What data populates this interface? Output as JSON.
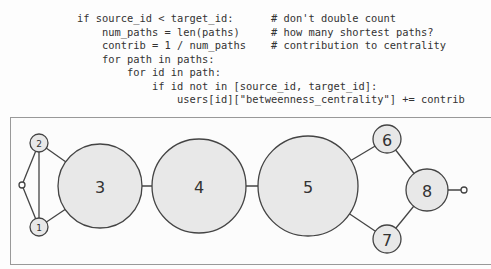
{
  "code": {
    "lines": [
      {
        "indent": 0,
        "code": "if source_id < target_id:",
        "comment": "# don't double count"
      },
      {
        "indent": 1,
        "code": "num_paths = len(paths)",
        "comment": "# how many shortest paths?"
      },
      {
        "indent": 1,
        "code": "contrib = 1 / num_paths",
        "comment": "# contribution to centrality"
      },
      {
        "indent": 1,
        "code": "for path in paths:",
        "comment": ""
      },
      {
        "indent": 2,
        "code": "for id in path:",
        "comment": ""
      },
      {
        "indent": 3,
        "code": "if id not in [source_id, target_id]:",
        "comment": ""
      },
      {
        "indent": 4,
        "code": "users[id][\"betweenness_centrality\"] += contrib",
        "comment": ""
      }
    ],
    "line0": "if source_id < target_id:      # don't double count",
    "line1": "    num_paths = len(paths)     # how many shortest paths?",
    "line2": "    contrib = 1 / num_paths    # contribution to centrality",
    "line3": "    for path in paths:",
    "line4": "        for id in path:",
    "line5": "            if id not in [source_id, target_id]:",
    "line6": "                users[id][\"betweenness_centrality\"] += contrib"
  },
  "graph": {
    "node_fill": "#e8e8e8",
    "stroke": "#444444",
    "nodes": [
      {
        "id": "0",
        "label": "",
        "x": 22,
        "y": 185,
        "r": 3
      },
      {
        "id": "1",
        "label": "1",
        "x": 39,
        "y": 227,
        "r": 9
      },
      {
        "id": "2",
        "label": "2",
        "x": 39,
        "y": 143,
        "r": 9
      },
      {
        "id": "3",
        "label": "3",
        "x": 100,
        "y": 186,
        "r": 42
      },
      {
        "id": "4",
        "label": "4",
        "x": 199,
        "y": 186,
        "r": 47
      },
      {
        "id": "5",
        "label": "5",
        "x": 308,
        "y": 186,
        "r": 50
      },
      {
        "id": "6",
        "label": "6",
        "x": 387,
        "y": 139,
        "r": 14
      },
      {
        "id": "7",
        "label": "7",
        "x": 387,
        "y": 239,
        "r": 14
      },
      {
        "id": "8",
        "label": "8",
        "x": 427,
        "y": 190,
        "r": 21
      },
      {
        "id": "9",
        "label": "",
        "x": 464,
        "y": 190,
        "r": 3
      }
    ],
    "edges": [
      [
        "0",
        "1"
      ],
      [
        "0",
        "2"
      ],
      [
        "1",
        "2"
      ],
      [
        "1",
        "3"
      ],
      [
        "2",
        "3"
      ],
      [
        "3",
        "4"
      ],
      [
        "4",
        "5"
      ],
      [
        "5",
        "6"
      ],
      [
        "5",
        "7"
      ],
      [
        "6",
        "8"
      ],
      [
        "7",
        "8"
      ],
      [
        "8",
        "9"
      ]
    ]
  }
}
